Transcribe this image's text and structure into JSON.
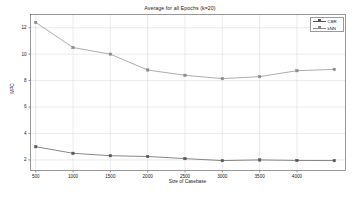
{
  "chart_data": {
    "type": "line",
    "title": "Average for all Epochs (k=20)",
    "xlabel": "Size of Casebase",
    "ylabel": "MPC",
    "x": [
      500,
      1000,
      1500,
      2000,
      2500,
      3000,
      3500,
      4000,
      4500
    ],
    "xticks": [
      500,
      1000,
      1500,
      2000,
      2500,
      3000,
      3500,
      4000
    ],
    "xtick_labels": [
      "500",
      "1000",
      "1500",
      "2000",
      "2500",
      "3000",
      "3500",
      "4000"
    ],
    "yticks": [
      2,
      4,
      6,
      8,
      10,
      12
    ],
    "ytick_labels": [
      "2",
      "4",
      "6",
      "8",
      "10",
      "12"
    ],
    "xlim": [
      430,
      4650
    ],
    "ylim": [
      1.2,
      13.0
    ],
    "grid": true,
    "legend_position": "top-right",
    "series": [
      {
        "name": "CBR",
        "color": "#555555",
        "marker": "square",
        "values": [
          3.0,
          2.5,
          2.32,
          2.26,
          2.1,
          1.95,
          2.0,
          1.96,
          1.95
        ]
      },
      {
        "name": "kNN",
        "color": "#8a8a8a",
        "marker": "square",
        "values": [
          12.4,
          10.5,
          10.0,
          8.8,
          8.4,
          8.15,
          8.3,
          8.75,
          8.85
        ]
      }
    ]
  },
  "legend": {
    "items": [
      {
        "label": "CBR"
      },
      {
        "label": "kNN"
      }
    ]
  },
  "colors": {
    "background": "#ffffff",
    "plot_background": "#ffffff",
    "axis": "#6b6b6b",
    "grid": "#d6d6d6",
    "text": "#1a1a1a",
    "series_cbr": "#555555",
    "series_knn": "#8a8a8a"
  }
}
